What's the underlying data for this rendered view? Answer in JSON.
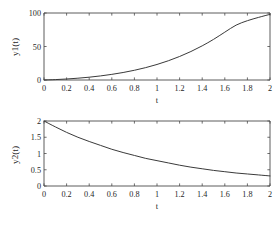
{
  "figure": {
    "background_color": "#ffffff",
    "axis_color": "#4a4a4a",
    "curve_color": "#3a3a3a",
    "text_color": "#1f1f1f"
  },
  "chart_data": [
    {
      "type": "line",
      "panel": "top",
      "title": "",
      "xlabel": "t",
      "ylabel": "y1(t)",
      "xlim": [
        0,
        2
      ],
      "ylim": [
        0,
        100
      ],
      "grid": false,
      "legend": "none",
      "xticks": [
        0,
        0.2,
        0.4,
        0.6,
        0.8,
        1,
        1.2,
        1.4,
        1.6,
        1.8,
        2
      ],
      "xticklabels": [
        "0",
        "0.2",
        "0.4",
        "0.6",
        "0.8",
        "1",
        "1.2",
        "1.4",
        "1.6",
        "1.8",
        "2"
      ],
      "yticks": [
        0,
        50,
        100
      ],
      "yticklabels": [
        "0",
        "50",
        "100"
      ],
      "series": [
        {
          "name": "y1(t)",
          "x": [
            0,
            0.1,
            0.2,
            0.3,
            0.4,
            0.5,
            0.6,
            0.7,
            0.8,
            0.9,
            1.0,
            1.1,
            1.2,
            1.3,
            1.4,
            1.5,
            1.6,
            1.7,
            1.8,
            1.9,
            2.0
          ],
          "y": [
            0.0,
            0.6,
            1.5,
            2.7,
            4.2,
            6.1,
            8.4,
            11.2,
            14.5,
            18.5,
            23.2,
            28.7,
            35.1,
            42.5,
            51.0,
            60.6,
            71.4,
            81.9,
            88.5,
            93.5,
            98.0
          ]
        }
      ]
    },
    {
      "type": "line",
      "panel": "bottom",
      "title": "",
      "xlabel": "t",
      "ylabel": "y2(t)",
      "xlim": [
        0,
        2
      ],
      "ylim": [
        0,
        2
      ],
      "grid": false,
      "legend": "none",
      "xticks": [
        0,
        0.2,
        0.4,
        0.6,
        0.8,
        1,
        1.2,
        1.4,
        1.6,
        1.8,
        2
      ],
      "xticklabels": [
        "0",
        "0.2",
        "0.4",
        "0.6",
        "0.8",
        "1",
        "1.2",
        "1.4",
        "1.6",
        "1.8",
        "2"
      ],
      "yticks": [
        0,
        0.5,
        1,
        1.5,
        2
      ],
      "yticklabels": [
        "0",
        "0.5",
        "1",
        "1.5",
        "2"
      ],
      "series": [
        {
          "name": "y2(t)",
          "x": [
            0,
            0.1,
            0.2,
            0.3,
            0.4,
            0.5,
            0.6,
            0.7,
            0.8,
            0.9,
            1.0,
            1.1,
            1.2,
            1.3,
            1.4,
            1.5,
            1.6,
            1.7,
            1.8,
            1.9,
            2.0
          ],
          "y": [
            2.0,
            1.82,
            1.65,
            1.5,
            1.37,
            1.25,
            1.13,
            1.03,
            0.94,
            0.85,
            0.78,
            0.71,
            0.64,
            0.58,
            0.53,
            0.48,
            0.44,
            0.4,
            0.37,
            0.34,
            0.31
          ]
        }
      ]
    }
  ],
  "top_chart": {
    "ylabel": "y1(t)",
    "xlabel": "t",
    "ytick_0": "0",
    "ytick_1": "50",
    "ytick_2": "100",
    "xtick_0": "0",
    "xtick_1": "0.2",
    "xtick_2": "0.4",
    "xtick_3": "0.6",
    "xtick_4": "0.8",
    "xtick_5": "1",
    "xtick_6": "1.2",
    "xtick_7": "1.4",
    "xtick_8": "1.6",
    "xtick_9": "1.8",
    "xtick_10": "2"
  },
  "bottom_chart": {
    "ylabel": "y2(t)",
    "xlabel": "t",
    "ytick_0": "0",
    "ytick_1": "0.5",
    "ytick_2": "1",
    "ytick_3": "1.5",
    "ytick_4": "2",
    "xtick_0": "0",
    "xtick_1": "0.2",
    "xtick_2": "0.4",
    "xtick_3": "0.6",
    "xtick_4": "0.8",
    "xtick_5": "1",
    "xtick_6": "1.2",
    "xtick_7": "1.4",
    "xtick_8": "1.6",
    "xtick_9": "1.8",
    "xtick_10": "2"
  }
}
